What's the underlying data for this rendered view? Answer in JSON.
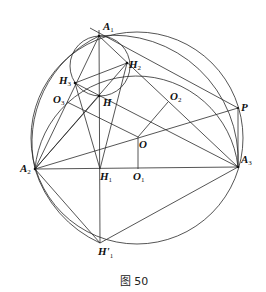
{
  "figure": {
    "caption": "图 50",
    "points": {
      "A1": {
        "main": "A",
        "sub": "1",
        "x": 99,
        "y": 36
      },
      "A2": {
        "main": "A",
        "sub": "2",
        "x": 35,
        "y": 169
      },
      "A3": {
        "main": "A",
        "sub": "3",
        "x": 238,
        "y": 167
      },
      "H": {
        "main": "H",
        "sub": "",
        "x": 99,
        "y": 96
      },
      "H1": {
        "main": "H",
        "sub": "1",
        "x": 100,
        "y": 169
      },
      "H1p": {
        "main": "H'",
        "sub": "1",
        "x": 100,
        "y": 243
      },
      "H2": {
        "main": "H",
        "sub": "2",
        "x": 127,
        "y": 63
      },
      "H3": {
        "main": "H",
        "sub": "3",
        "x": 75,
        "y": 83
      },
      "O": {
        "main": "O",
        "sub": "",
        "x": 138,
        "y": 137
      },
      "O1": {
        "main": "O",
        "sub": "1",
        "x": 138,
        "y": 169
      },
      "O2": {
        "main": "O",
        "sub": "2",
        "x": 168,
        "y": 102
      },
      "O3": {
        "main": "O",
        "sub": "3",
        "x": 67,
        "y": 102
      },
      "P": {
        "main": "P",
        "sub": "",
        "x": 238,
        "y": 108
      }
    }
  }
}
